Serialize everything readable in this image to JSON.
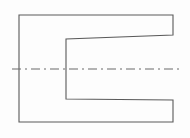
{
  "drawing": {
    "title": "U-shaped bracket outline with horizontal centerline",
    "canvas": {
      "width": 190,
      "height": 138
    },
    "background_color": "#fdfdfd",
    "outline": {
      "name": "u-shaped-part-outline",
      "stroke_color": "#5a5a5a",
      "stroke_width": 1.1,
      "fill": "none",
      "points": "19,15 173,15 173,35 66,39 66,99 173,100 173,122 19,122",
      "path": "M 19 15 L 173 15 L 173 35 L 66 39 L 66 99 L 173 100 L 173 122 L 19 122 Z",
      "vertices": [
        {
          "label": "top-left-corner",
          "x": 19,
          "y": 15
        },
        {
          "label": "top-right-corner",
          "x": 173,
          "y": 15
        },
        {
          "label": "upper-arm-inner-right",
          "x": 173,
          "y": 35
        },
        {
          "label": "notch-top-left",
          "x": 66,
          "y": 39
        },
        {
          "label": "notch-bottom-left",
          "x": 66,
          "y": 99
        },
        {
          "label": "lower-arm-inner-right",
          "x": 173,
          "y": 100
        },
        {
          "label": "bottom-right-corner",
          "x": 173,
          "y": 122
        },
        {
          "label": "bottom-left-corner",
          "x": 19,
          "y": 122
        }
      ]
    },
    "centerline": {
      "name": "horizontal-centerline",
      "stroke_color": "#6a6a6a",
      "stroke_width": 1.1,
      "dash_pattern": "9 4 2 4",
      "x1": 12,
      "y1": 69,
      "x2": 180,
      "y2": 69
    }
  }
}
